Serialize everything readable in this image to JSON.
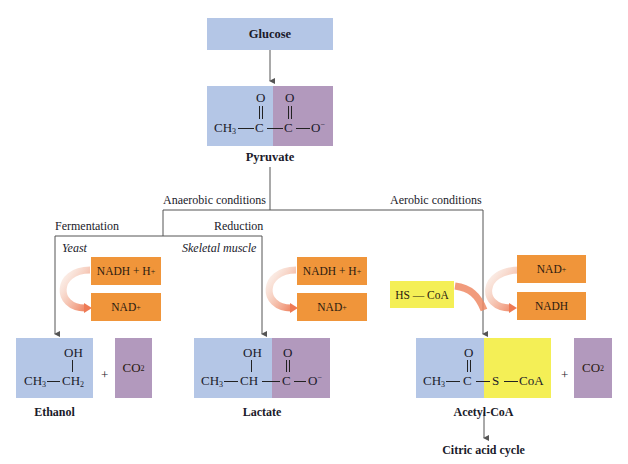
{
  "glucose": {
    "label": "Glucose"
  },
  "pyruvate": {
    "name": "Pyruvate",
    "formula": {
      "ch3": "CH",
      "ch3_sub": "3",
      "c1": "C",
      "c2": "C",
      "o_top1": "O",
      "o_top2": "O",
      "o_end": "O",
      "charge": "−",
      "bond": "—"
    }
  },
  "branches": {
    "anaerobic": "Anaerobic conditions",
    "aerobic": "Aerobic conditions",
    "fermentation": "Fermentation",
    "reduction": "Reduction",
    "yeast": "Yeast",
    "skeletal_muscle": "Skeletal muscle"
  },
  "cofactors": {
    "ferm_in": "NADH + H",
    "ferm_in_sup": "+",
    "ferm_out": "NAD",
    "ferm_out_sup": "+",
    "red_in": "NADH + H",
    "red_in_sup": "+",
    "red_out": "NAD",
    "red_out_sup": "+",
    "aer_in": "NAD",
    "aer_in_sup": "+",
    "aer_out": "NADH",
    "hscoa": "HS — CoA"
  },
  "ethanol": {
    "name": "Ethanol",
    "oh": "OH",
    "ch3": "CH",
    "ch3_sub": "3",
    "ch2": "CH",
    "ch2_sub": "2",
    "plus": "+",
    "co2": "CO",
    "co2_sub": "2"
  },
  "lactate": {
    "name": "Lactate",
    "oh": "OH",
    "ch3": "CH",
    "ch3_sub": "3",
    "ch": "CH",
    "c": "C",
    "o_top": "O",
    "o_end": "O",
    "charge": "−"
  },
  "acetyl_coa": {
    "name": "Acetyl-CoA",
    "ch3": "CH",
    "ch3_sub": "3",
    "c": "C",
    "o_top": "O",
    "s": "S",
    "coa": "CoA",
    "plus": "+",
    "co2": "CO",
    "co2_sub": "2"
  },
  "citric": {
    "label": "Citric acid cycle"
  },
  "colors": {
    "blue": "#b4c6e6",
    "purple": "#b299bd",
    "yellow": "#f4ef56",
    "orange": "#f0953a",
    "line": "#555555"
  }
}
